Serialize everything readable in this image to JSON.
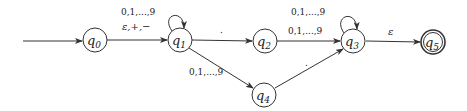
{
  "diagram": {
    "type": "finite-automaton",
    "start_state": "q0",
    "accept_states": [
      "q5"
    ],
    "states": [
      {
        "id": "q0",
        "name": "q",
        "sub": "0",
        "x": 95,
        "y": 40,
        "accepting": false
      },
      {
        "id": "q1",
        "name": "q",
        "sub": "1",
        "x": 180,
        "y": 40,
        "accepting": false
      },
      {
        "id": "q2",
        "name": "q",
        "sub": "2",
        "x": 265,
        "y": 41,
        "accepting": false
      },
      {
        "id": "q3",
        "name": "q",
        "sub": "3",
        "x": 353,
        "y": 41,
        "accepting": false
      },
      {
        "id": "q4",
        "name": "q",
        "sub": "4",
        "x": 264,
        "y": 95,
        "accepting": false
      },
      {
        "id": "q5",
        "name": "q",
        "sub": "5",
        "x": 433,
        "y": 42,
        "accepting": true
      }
    ],
    "transitions": [
      {
        "from": "start",
        "to": "q0",
        "label": ""
      },
      {
        "from": "q0",
        "to": "q1",
        "label": "ε,+,−"
      },
      {
        "from": "q1",
        "to": "q1",
        "label": "0,1,...,9"
      },
      {
        "from": "q1",
        "to": "q2",
        "label": "."
      },
      {
        "from": "q1",
        "to": "q4",
        "label": "0,1,...,9"
      },
      {
        "from": "q2",
        "to": "q3",
        "label": "0,1,...,9"
      },
      {
        "from": "q3",
        "to": "q3",
        "label": "0,1,...,9"
      },
      {
        "from": "q4",
        "to": "q3",
        "label": "."
      },
      {
        "from": "q3",
        "to": "q5",
        "label": "ε"
      }
    ]
  },
  "labels": {
    "q0": {
      "name": "q",
      "sub": "0"
    },
    "q1": {
      "name": "q",
      "sub": "1"
    },
    "q2": {
      "name": "q",
      "sub": "2"
    },
    "q3": {
      "name": "q",
      "sub": "3"
    },
    "q4": {
      "name": "q",
      "sub": "4"
    },
    "q5": {
      "name": "q",
      "sub": "5"
    },
    "q0_q1": "ε,+,−",
    "q1_loop": "0,1,...,9",
    "q1_q2": ".",
    "q1_q4": "0,1,...,9",
    "q2_q3": "0,1,...,9",
    "q3_loop": "0,1,...,9",
    "q4_q3": ".",
    "q3_q5": "ε"
  }
}
